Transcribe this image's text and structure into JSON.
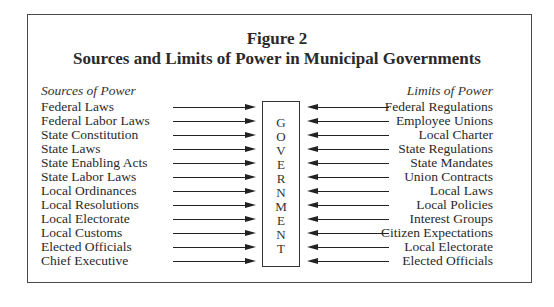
{
  "figure": {
    "label": "Figure 2",
    "title": "Sources and Limits of Power in Municipal Governments"
  },
  "sources": {
    "header": "Sources of Power",
    "items": [
      "Federal Laws",
      "Federal Labor Laws",
      "State Constitution",
      "State Laws",
      "State Enabling Acts",
      "State Labor Laws",
      "Local Ordinances",
      "Local Resolutions",
      "Local Electorate",
      "Local Customs",
      "Elected Officials",
      "Chief Executive"
    ]
  },
  "limits": {
    "header": "Limits of Power",
    "items": [
      "Federal Regulations",
      "Employee Unions",
      "Local Charter",
      "State Regulations",
      "State Mandates",
      "Union Contracts",
      "Local Laws",
      "Local Policies",
      "Interest Groups",
      "Citizen Expectations",
      "Local Electorate",
      "Elected Officials"
    ]
  },
  "center": {
    "label": "GOVERNMENT",
    "letters": [
      "G",
      "O",
      "V",
      "E",
      "R",
      "N",
      "M",
      "E",
      "N",
      "T"
    ]
  }
}
